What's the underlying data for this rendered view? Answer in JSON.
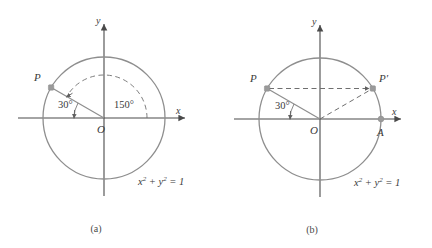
{
  "figure": {
    "colors": {
      "circle_stroke": "#8e8e8e",
      "axis_stroke": "#4a4a4a",
      "radius_stroke": "#8e8e8e",
      "dashed_stroke": "#6f6f6f",
      "point_fill": "#9a9a9a",
      "text": "#3a3a3a",
      "background": "#ffffff"
    },
    "panels": [
      {
        "id": "a",
        "caption": "(a)",
        "center": {
          "label": "O",
          "x": 104,
          "y": 118
        },
        "radius": 61,
        "axis_x_label": "x",
        "axis_y_label": "y",
        "equation": {
          "base1": "x",
          "sup1": "2",
          "plus": " + ",
          "base2": "y",
          "sup2": "2",
          "equals": " = 1"
        },
        "equation_text": "x2 + y2 = 1",
        "points": [
          {
            "name": "P",
            "label": "P",
            "angle_deg": 150,
            "marker": true
          }
        ],
        "angles": [
          {
            "label": "30°",
            "value": 30,
            "from_deg": 180,
            "to_deg": 150,
            "style": "solid"
          },
          {
            "label": "150°",
            "value": 150,
            "from_deg": 0,
            "to_deg": 150,
            "style": "dashed"
          }
        ],
        "segments": [
          {
            "name": "radius-OP",
            "from": "O",
            "to": "P",
            "style": "solid"
          }
        ]
      },
      {
        "id": "b",
        "caption": "(b)",
        "center": {
          "label": "O",
          "x": 320,
          "y": 119
        },
        "radius": 61,
        "axis_x_label": "x",
        "axis_y_label": "y",
        "equation": {
          "base1": "x",
          "sup1": "2",
          "plus": " + ",
          "base2": "y",
          "sup2": "2",
          "equals": " = 1"
        },
        "equation_text": "x2 + y2 = 1",
        "points": [
          {
            "name": "P",
            "label": "P",
            "angle_deg": 150,
            "marker": true
          },
          {
            "name": "P-prime",
            "label": "P′",
            "angle_deg": 30,
            "marker": true
          },
          {
            "name": "A",
            "label": "A",
            "angle_deg": 0,
            "marker": true
          }
        ],
        "angles": [
          {
            "label": "30°",
            "value": 30,
            "from_deg": 180,
            "to_deg": 150,
            "style": "solid"
          }
        ],
        "segments": [
          {
            "name": "radius-OP",
            "from": "O",
            "to": "P",
            "style": "solid"
          },
          {
            "name": "radius-OPprime",
            "from": "O",
            "to": "P-prime",
            "style": "dashed"
          },
          {
            "name": "chord-P-Pprime",
            "from": "P",
            "to": "P-prime",
            "style": "dashed"
          }
        ]
      }
    ]
  }
}
